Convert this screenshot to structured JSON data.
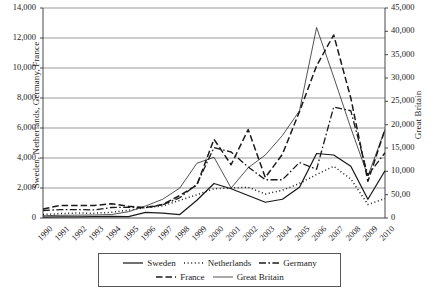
{
  "chart_data": {
    "type": "line",
    "title": "",
    "xlabel": "",
    "ylabel": "Sweden, Netherlands, Germany, France",
    "ylabel_secondary": "Great Britain",
    "grid": true,
    "legend_position": "bottom",
    "x": [
      1990,
      1991,
      1992,
      1993,
      1994,
      1995,
      1996,
      1997,
      1998,
      1999,
      2000,
      2001,
      2002,
      2003,
      2004,
      2005,
      2006,
      2007,
      2008,
      2009,
      2010
    ],
    "categories": [
      "1990",
      "1991",
      "1992",
      "1993",
      "1994",
      "1995",
      "1996",
      "1997",
      "1998",
      "1999",
      "2000",
      "2001",
      "2002",
      "2003",
      "2004",
      "2005",
      "2006",
      "2007",
      "2008",
      "2009",
      "2010"
    ],
    "ylim": [
      0,
      14000
    ],
    "yticks": [
      0,
      2000,
      4000,
      6000,
      8000,
      10000,
      12000,
      14000
    ],
    "ytick_labels": [
      "0",
      "2,000",
      "4,000",
      "6,000",
      "8,000",
      "10,000",
      "12,000",
      "14,000"
    ],
    "ylim_secondary": [
      0,
      45000
    ],
    "yticks_secondary": [
      0,
      5000,
      10000,
      15000,
      20000,
      25000,
      30000,
      35000,
      40000,
      45000
    ],
    "ytick_labels_secondary": [
      "0",
      "50,00",
      "10,000",
      "15,000",
      "20,000",
      "25,000",
      "30,000",
      "35,000",
      "40,000",
      "45,000"
    ],
    "series": [
      {
        "name": "Sweden",
        "axis": "left",
        "style": "solid",
        "values": [
          60,
          70,
          80,
          90,
          110,
          90,
          380,
          330,
          230,
          1180,
          2300,
          1950,
          1500,
          1050,
          1250,
          2050,
          4300,
          4200,
          3450,
          1250,
          3150
        ]
      },
      {
        "name": "Netherlands",
        "axis": "left",
        "style": "dotted",
        "values": [
          230,
          290,
          330,
          320,
          380,
          520,
          700,
          800,
          1180,
          1550,
          1950,
          2000,
          2050,
          1600,
          1850,
          2300,
          2900,
          3450,
          2600,
          900,
          1300
        ]
      },
      {
        "name": "Germany",
        "axis": "left",
        "style": "dashdot",
        "values": [
          500,
          560,
          560,
          540,
          700,
          720,
          680,
          880,
          1350,
          2250,
          4700,
          4400,
          3400,
          2550,
          2550,
          3700,
          3250,
          7400,
          7150,
          2850,
          4350
        ]
      },
      {
        "name": "France",
        "axis": "left",
        "style": "dashed",
        "values": [
          600,
          840,
          830,
          830,
          950,
          780,
          700,
          900,
          1500,
          2200,
          5250,
          3550,
          5900,
          2700,
          4250,
          7100,
          10150,
          12200,
          8000,
          2450,
          5900
        ]
      },
      {
        "name": "Great Britain",
        "axis": "right",
        "style": "thin-solid",
        "values_left_scale": [
          150,
          180,
          190,
          200,
          230,
          420,
          800,
          1250,
          2000,
          3650,
          4050,
          2000,
          3350,
          4200,
          5500,
          7150,
          12700,
          9400,
          6000,
          2800,
          5900
        ],
        "values": [
          482,
          579,
          611,
          643,
          739,
          1350,
          2571,
          4018,
          6429,
          11732,
          13018,
          6429,
          10768,
          13500,
          17679,
          22982,
          40821,
          30214,
          19286,
          9000,
          18964
        ]
      }
    ],
    "legend": [
      {
        "label": "Sweden",
        "style": "solid"
      },
      {
        "label": "Netherlands",
        "style": "dotted"
      },
      {
        "label": "Germany",
        "style": "dashdot"
      },
      {
        "label": "France",
        "style": "dashed"
      },
      {
        "label": "Great Britain",
        "style": "thin-solid"
      }
    ],
    "colors": {
      "line": "#1a1a1a",
      "grid": "#808080",
      "axis": "#333333",
      "background": "#ffffff"
    }
  }
}
